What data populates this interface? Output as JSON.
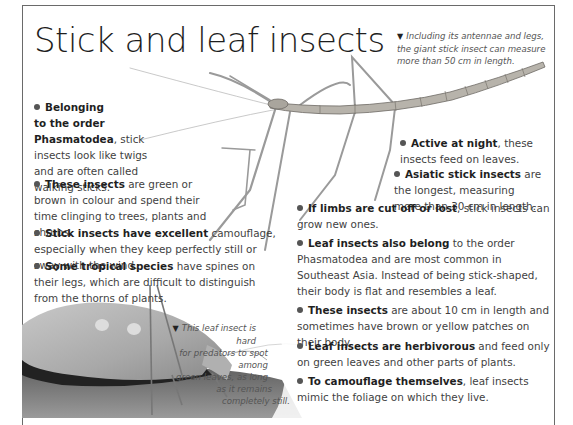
{
  "page": {
    "title": "Stick and leaf insects"
  },
  "captions": {
    "giant_stick": {
      "marker": "▼",
      "text": "Including its antennae and legs, the giant stick insect can measure more than 50 cm in length."
    },
    "leaf_insect": {
      "marker": "▼",
      "lines": [
        "This leaf insect is hard",
        "for predators to spot among",
        "green leaves, as long",
        "as it remains",
        "completely still."
      ]
    }
  },
  "facts": [
    {
      "bold": "Belonging to the order Phasmatodea",
      "rest": ", stick insects look like twigs and are often called walking sticks."
    },
    {
      "bold": "These insects",
      "rest": " are green or brown in colour and spend their time clinging to trees, plants and shrubs."
    },
    {
      "bold": "Stick insects have excellent",
      "rest": " camouflage, especially when they keep perfectly still or sway with the wind."
    },
    {
      "bold": "Some tropical species",
      "rest": " have spines on their legs, which are difficult to distinguish from the thorns of plants."
    },
    {
      "bold": "Active at night",
      "rest": ", these insects feed on leaves."
    },
    {
      "bold": "Asiatic stick insects",
      "rest": " are the longest, measuring more than 30 cm in length."
    },
    {
      "bold": "If limbs are cut off or lost",
      "rest": ", stick insects can grow new ones."
    },
    {
      "bold": "Leaf insects also belong",
      "rest": " to the order Phasmatodea and are most common in Southeast Asia. Instead of being stick-shaped, their body is flat and resembles a leaf."
    },
    {
      "bold": "These insects",
      "rest": " are about 10 cm in length and sometimes have brown or yellow patches on their body."
    },
    {
      "bold": "Leaf insects are herbivorous",
      "rest": " and feed only on green leaves and other parts of plants."
    },
    {
      "bold": "To camouflage themselves",
      "rest": ", leaf insects mimic the foliage on which they live."
    }
  ],
  "fact0_lines": {
    "l1": "Belonging",
    "l2": "to the order",
    "l3": "Phasmatodea",
    "l3rest": ", stick",
    "l4": "insects look like twigs",
    "l5": "and are often called",
    "l6": "walking sticks."
  },
  "images": {
    "stick_insect": "giant stick insect illustration",
    "leaf_insect": "leaf insect photograph"
  }
}
